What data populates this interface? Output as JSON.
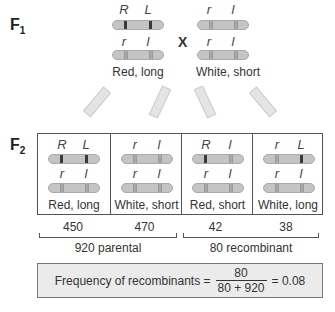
{
  "f1": {
    "label": "F",
    "sub": "1",
    "cross_symbol": "X",
    "left_parent": {
      "top": {
        "a1": "R",
        "a2": "L"
      },
      "bottom": {
        "a1": "r",
        "a2": "l"
      },
      "phenotype": "Red, long"
    },
    "right_parent": {
      "top": {
        "a1": "r",
        "a2": "l"
      },
      "bottom": {
        "a1": "r",
        "a2": "l"
      },
      "phenotype": "White, short"
    }
  },
  "f2": {
    "label": "F",
    "sub": "2",
    "offspring": [
      {
        "top": {
          "a1": "R",
          "a2": "L"
        },
        "bottom": {
          "a1": "r",
          "a2": "l"
        },
        "phenotype": "Red, long",
        "count": "450"
      },
      {
        "top": {
          "a1": "r",
          "a2": "l"
        },
        "bottom": {
          "a1": "r",
          "a2": "l"
        },
        "phenotype": "White, short",
        "count": "470"
      },
      {
        "top": {
          "a1": "R",
          "a2": "l"
        },
        "bottom": {
          "a1": "r",
          "a2": "l"
        },
        "phenotype": "Red, short",
        "count": "42"
      },
      {
        "top": {
          "a1": "r",
          "a2": "L"
        },
        "bottom": {
          "a1": "r",
          "a2": "l"
        },
        "phenotype": "White, long",
        "count": "38"
      }
    ],
    "parental_total": "920 parental",
    "recombinant_total": "80 recombinant"
  },
  "formula": {
    "label": "Frequency of recombinants =",
    "numerator": "80",
    "denominator": "80 + 920",
    "result": "= 0.08"
  }
}
